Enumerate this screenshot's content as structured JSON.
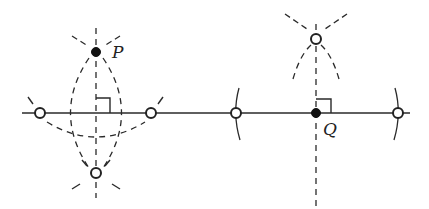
{
  "diagram": {
    "colors": {
      "stroke": "#2a2a2a",
      "background": "#ffffff"
    },
    "line": {
      "x1": 22,
      "y1": 113,
      "x2": 410,
      "y2": 113
    },
    "left_construction": {
      "point_label": "P",
      "point": {
        "x": 96,
        "y": 52
      },
      "foot": {
        "x": 96,
        "y": 113
      },
      "open_points": [
        {
          "x": 40,
          "y": 113
        },
        {
          "x": 151,
          "y": 113
        },
        {
          "x": 96,
          "y": 173
        }
      ],
      "perpendicular": {
        "x": 96,
        "y1": 28,
        "y2": 197
      }
    },
    "right_construction": {
      "point_label": "Q",
      "point": {
        "x": 316,
        "y": 113
      },
      "open_points": [
        {
          "x": 236,
          "y": 113
        },
        {
          "x": 398,
          "y": 113
        },
        {
          "x": 316,
          "y": 39
        }
      ],
      "perpendicular": {
        "x": 316,
        "y1": 24,
        "y2": 206
      }
    }
  }
}
